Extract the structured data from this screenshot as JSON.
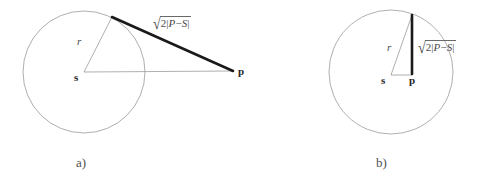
{
  "figure": {
    "background_color": "#ffffff",
    "stroke_color_thin": "#8c8c8c",
    "stroke_color_thick": "#1a1a1a",
    "panels": [
      {
        "id": "a",
        "caption": "a)",
        "description": "circle with center s and external point p joined by a thick segment from the circle to p",
        "circle": {
          "cx": 84,
          "cy": 72,
          "r": 61
        },
        "center_label": "s",
        "point_label": "p",
        "radius_label": "r",
        "length_label": {
          "sqrt_sign": "√",
          "expr_prefix": "2",
          "abs_open": "|",
          "term_left": "P",
          "minus": "−",
          "term_right": "S",
          "abs_close": "|",
          "full_text": "√2|P − S|"
        },
        "center_point": {
          "x": 84,
          "y": 72
        },
        "outer_point": {
          "x": 233,
          "y": 71
        },
        "tangent_point": {
          "x": 112,
          "y": 17
        }
      },
      {
        "id": "b",
        "caption": "b)",
        "description": "circle with center s and interior point p joined by a thick vertical chord to the circle",
        "circle": {
          "cx": 391,
          "cy": 72,
          "r": 62
        },
        "center_label": "s",
        "point_label": "p",
        "radius_label": "r",
        "length_label": {
          "sqrt_sign": "√",
          "expr_prefix": "2",
          "abs_open": "|",
          "term_left": "P",
          "minus": "−",
          "term_right": "S",
          "abs_close": "|",
          "full_text": "√2|P − S|"
        },
        "center_point": {
          "x": 391,
          "y": 75
        },
        "inner_point": {
          "x": 412,
          "y": 74
        },
        "chord_top": {
          "x": 412,
          "y": 15
        }
      }
    ]
  }
}
